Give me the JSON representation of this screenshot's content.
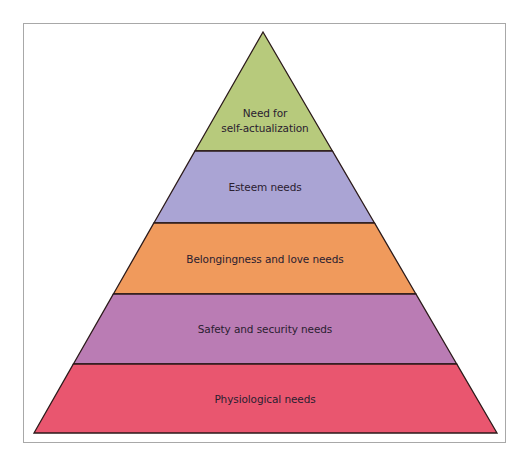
{
  "diagram": {
    "type": "pyramid",
    "apex": [
      263,
      32
    ],
    "base_y": 433,
    "base_left_x": 34,
    "base_right_x": 497,
    "outline_color": "#2b1a1a",
    "tiers": [
      {
        "id": "self-actualization",
        "label_line1": "Need for",
        "label_line2": "self-actualization",
        "color": "#b7ca7c",
        "top_y": 32,
        "bottom_y": 151,
        "label_y": 121
      },
      {
        "id": "esteem",
        "label": "Esteem needs",
        "color": "#aaa4d4",
        "top_y": 151,
        "bottom_y": 223,
        "label_y": 187
      },
      {
        "id": "belongingness",
        "label": "Belongingness and love needs",
        "color": "#f09a5c",
        "top_y": 223,
        "bottom_y": 294,
        "label_y": 259
      },
      {
        "id": "safety",
        "label": "Safety and security needs",
        "color": "#ba7cb4",
        "top_y": 294,
        "bottom_y": 364,
        "label_y": 329
      },
      {
        "id": "physiological",
        "label": "Physiological needs",
        "color": "#e9566f",
        "top_y": 364,
        "bottom_y": 433,
        "label_y": 399
      }
    ]
  }
}
